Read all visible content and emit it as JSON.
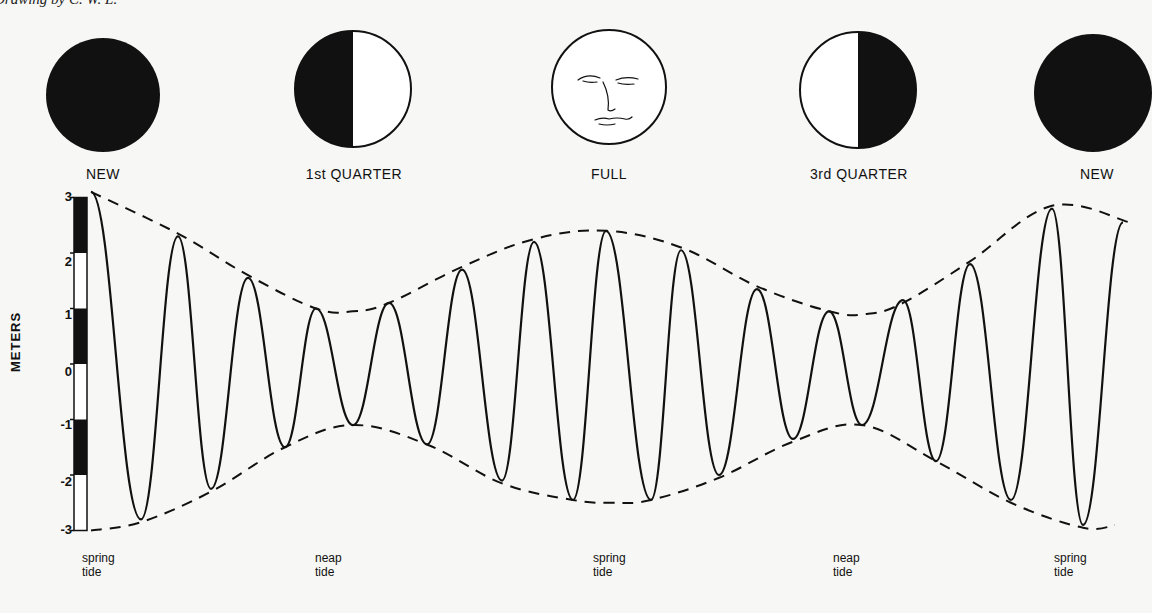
{
  "credit": "Drawing by C. W. L.",
  "moon_phases": [
    {
      "label": "NEW",
      "type": "new",
      "cx": 103,
      "cy": 95,
      "r": 57
    },
    {
      "label": "1st QUARTER",
      "type": "first-quarter",
      "cx": 353,
      "cy": 89,
      "r": 58
    },
    {
      "label": "FULL",
      "type": "full",
      "cx": 609,
      "cy": 87,
      "r": 57
    },
    {
      "label": "3rd QUARTER",
      "type": "third-quarter",
      "cx": 858,
      "cy": 90,
      "r": 58
    },
    {
      "label": "NEW",
      "type": "new",
      "cx": 1093,
      "cy": 93,
      "r": 59
    }
  ],
  "y_axis": {
    "title": "METERS",
    "ticks": [
      {
        "label": "3",
        "value": 3
      },
      {
        "label": "2",
        "value": 2
      },
      {
        "label": "1",
        "value": 1
      },
      {
        "label": "0",
        "value": 0
      },
      {
        "label": "-1",
        "value": -1
      },
      {
        "label": "-2",
        "value": -2
      },
      {
        "label": "-3",
        "value": -3
      }
    ]
  },
  "tide_labels": [
    {
      "line1": "spring",
      "line2": "tide",
      "x": 82
    },
    {
      "line1": "neap",
      "line2": "tide",
      "x": 315
    },
    {
      "line1": "spring",
      "line2": "tide",
      "x": 593
    },
    {
      "line1": "neap",
      "line2": "tide",
      "x": 833
    },
    {
      "line1": "spring",
      "line2": "tide",
      "x": 1054
    }
  ],
  "chart_data": {
    "type": "line",
    "xlabel": "",
    "ylabel": "METERS",
    "ylim": [
      -3,
      3
    ],
    "grid": false,
    "phase_labels": [
      "NEW",
      "1st QUARTER",
      "FULL",
      "3rd QUARTER",
      "NEW"
    ],
    "annotations": [
      "spring tide",
      "neap tide",
      "spring tide",
      "neap tide",
      "spring tide"
    ],
    "series": [
      {
        "name": "tide height (extrema, alternating high/low)",
        "x": [
          91,
          141,
          178,
          211,
          248,
          285,
          316,
          353,
          389,
          427,
          462,
          502,
          534,
          573,
          606,
          651,
          681,
          719,
          757,
          793,
          829,
          862,
          903,
          936,
          970,
          1011,
          1052,
          1083,
          1123
        ],
        "values": [
          3.1,
          -2.8,
          2.3,
          -2.25,
          1.55,
          -1.5,
          1.0,
          -1.1,
          1.1,
          -1.45,
          1.7,
          -2.1,
          2.2,
          -2.45,
          2.4,
          -2.45,
          2.05,
          -2.0,
          1.35,
          -1.35,
          0.95,
          -1.1,
          1.15,
          -1.75,
          1.8,
          -2.45,
          2.8,
          -2.9,
          2.55
        ]
      },
      {
        "name": "upper envelope (dashed)",
        "x": [
          91,
          178,
          248,
          316,
          353,
          389,
          462,
          534,
          606,
          681,
          757,
          829,
          866,
          903,
          970,
          1052,
          1130
        ],
        "values": [
          3.1,
          2.35,
          1.6,
          1.0,
          0.95,
          1.1,
          1.75,
          2.25,
          2.4,
          2.1,
          1.4,
          0.95,
          0.9,
          1.1,
          1.85,
          2.85,
          2.55
        ]
      },
      {
        "name": "lower envelope (dashed)",
        "x": [
          91,
          141,
          211,
          285,
          353,
          427,
          502,
          573,
          612,
          651,
          719,
          793,
          862,
          936,
          1011,
          1083,
          1115
        ],
        "values": [
          -3.0,
          -2.85,
          -2.3,
          -1.5,
          -1.1,
          -1.45,
          -2.15,
          -2.45,
          -2.5,
          -2.45,
          -2.05,
          -1.4,
          -1.1,
          -1.75,
          -2.5,
          -2.95,
          -2.9
        ]
      }
    ],
    "scale_bar": {
      "segments": [
        {
          "from": 3,
          "to": 2,
          "fill": "black"
        },
        {
          "from": 2,
          "to": 1,
          "fill": "white"
        },
        {
          "from": 1,
          "to": 0,
          "fill": "black"
        },
        {
          "from": 0,
          "to": -1,
          "fill": "white"
        },
        {
          "from": -1,
          "to": -2,
          "fill": "black"
        },
        {
          "from": -2,
          "to": -3,
          "fill": "white"
        }
      ]
    }
  },
  "colors": {
    "ink": "#111111",
    "paper": "#f7f7f5"
  }
}
